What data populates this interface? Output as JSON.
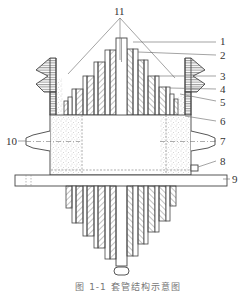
{
  "figure": {
    "type": "cross-section diagram",
    "callouts": [
      {
        "id": "1",
        "x": 220,
        "y": 38
      },
      {
        "id": "2",
        "x": 220,
        "y": 51
      },
      {
        "id": "3",
        "x": 220,
        "y": 72
      },
      {
        "id": "4",
        "x": 220,
        "y": 85
      },
      {
        "id": "5",
        "x": 220,
        "y": 98
      },
      {
        "id": "6",
        "x": 220,
        "y": 117
      },
      {
        "id": "7",
        "x": 220,
        "y": 137
      },
      {
        "id": "8",
        "x": 220,
        "y": 157
      },
      {
        "id": "9",
        "x": 232,
        "y": 175
      },
      {
        "id": "10",
        "x": 9,
        "y": 137
      },
      {
        "id": "11",
        "x": 116,
        "y": 8
      }
    ],
    "caption": "图 1-1  套管结构示意图"
  },
  "colors": {
    "line": "#444444",
    "hatch": "#666666",
    "stipple": "#999999",
    "background": "#ffffff"
  }
}
